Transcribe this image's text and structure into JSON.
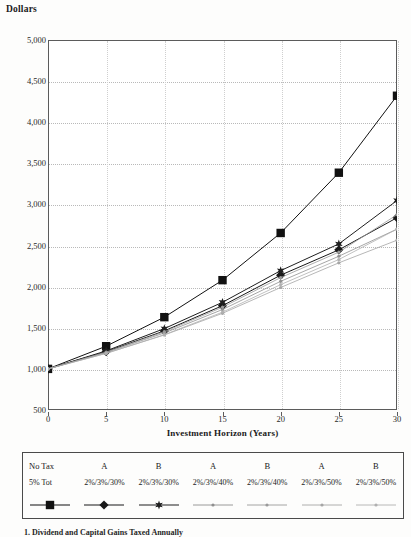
{
  "chart_data": {
    "type": "line",
    "title": "",
    "ylabel": "Dollars",
    "xlabel": "Investment Horizon (Years)",
    "x": [
      0,
      5,
      10,
      15,
      20,
      25,
      30
    ],
    "xlim": [
      0,
      30
    ],
    "ylim": [
      500,
      5000
    ],
    "y_ticks": [
      "500",
      "1,000",
      "1,500",
      "2,000",
      "2,500",
      "3,000",
      "3,500",
      "4,000",
      "4,500",
      "5,000"
    ],
    "y_tick_values": [
      500,
      1000,
      1500,
      2000,
      2500,
      3000,
      3500,
      4000,
      4500,
      5000
    ],
    "x_tick_labels": [
      "0",
      "5",
      "10",
      "15",
      "20",
      "25",
      "30"
    ],
    "grid": true,
    "legend_position": "below",
    "series": [
      {
        "name": "No Tax 5% Tot",
        "group": "No Tax",
        "detail": "5% Tot",
        "marker": "square",
        "color": "#111111",
        "values": [
          1000,
          1276,
          1629,
          2079,
          2653,
          3386,
          4322
        ]
      },
      {
        "name": "A 2%/3%/30%",
        "group": "A",
        "detail": "2%/3%/30%",
        "marker": "diamond",
        "color": "#181818",
        "values": [
          1000,
          1210,
          1462,
          1769,
          2140,
          2448,
          2839
        ]
      },
      {
        "name": "B 2%/3%/30%",
        "group": "B",
        "detail": "2%/3%/30%",
        "marker": "star",
        "color": "#1f1f1f",
        "values": [
          1000,
          1219,
          1490,
          1810,
          2195,
          2520,
          3048
        ]
      },
      {
        "name": "A 2%/3%/40%",
        "group": "A",
        "detail": "2%/3%/40%",
        "marker": "line-light",
        "color": "#8f8f8f",
        "values": [
          1000,
          1200,
          1437,
          1722,
          2065,
          2370,
          2700
        ]
      },
      {
        "name": "B 2%/3%/40%",
        "group": "B",
        "detail": "2%/3%/40%",
        "marker": "line-light",
        "color": "#9a9a9a",
        "values": [
          1000,
          1204,
          1452,
          1750,
          2110,
          2420,
          2875
        ]
      },
      {
        "name": "A 2%/3%/50%",
        "group": "A",
        "detail": "2%/3%/50%",
        "marker": "line-light",
        "color": "#a5a5a5",
        "values": [
          1000,
          1190,
          1412,
          1676,
          1990,
          2290,
          2565
        ]
      },
      {
        "name": "B 2%/3%/50%",
        "group": "B",
        "detail": "2%/3%/50%",
        "marker": "line-light",
        "color": "#b0b0b0",
        "values": [
          1000,
          1188,
          1416,
          1690,
          2025,
          2330,
          2700
        ]
      }
    ]
  },
  "legend": {
    "headers": [
      "No Tax",
      "A",
      "B",
      "A",
      "B",
      "A",
      "B"
    ],
    "subheaders": [
      "5% Tot",
      "2%/3%/30%",
      "2%/3%/30%",
      "2%/3%/40%",
      "2%/3%/40%",
      "2%/3%/50%",
      "2%/3%/50%"
    ]
  },
  "caption": {
    "text": "1. Dividend and Capital Gains Taxed Annually"
  },
  "colors": {
    "axis": "#5b5b5b",
    "grid": "#b9b9b9",
    "text": "#1a1a1a",
    "page_background": "#fdfdfc"
  }
}
